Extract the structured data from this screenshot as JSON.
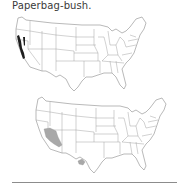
{
  "title": "Paperbag-bush.",
  "maps": [
    {
      "name": "native-range-map",
      "region": "United States",
      "highlight_color": "#1e1e1e",
      "highlighted_areas": [
        "California (Sierra Nevada foothills / central coast)"
      ]
    },
    {
      "name": "distribution-map",
      "region": "United States",
      "highlight_color": "#a8a8a8",
      "highlighted_areas": [
        "Southern California / Southern Nevada / Western Arizona",
        "West Texas (Big Bend)"
      ]
    }
  ],
  "colors": {
    "text": "#3a3a3a",
    "map_outline": "#8a8a8a",
    "rule": "#8c8c8c"
  }
}
